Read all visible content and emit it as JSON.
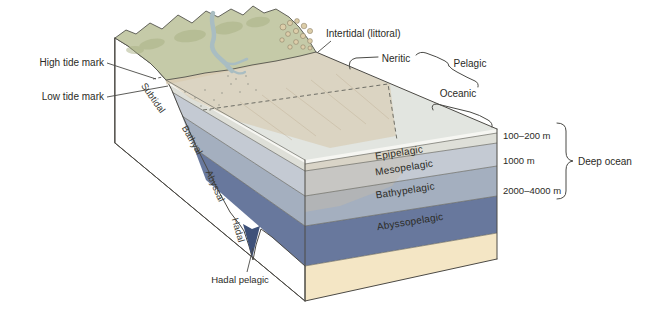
{
  "shore": {
    "high_tide": "High tide mark",
    "low_tide": "Low tide mark",
    "intertidal": "Intertidal (littoral)"
  },
  "surface_zones": {
    "neritic": "Neritic",
    "pelagic": "Pelagic",
    "oceanic": "Oceanic"
  },
  "benthic_zones": [
    "Subtidal",
    "Bathyal",
    "Abyssal",
    "Hadal"
  ],
  "pelagic_zones": [
    "Epipelagic",
    "Mesopelagic",
    "Bathypelagic",
    "Abyssopelagic",
    "Hadal pelagic"
  ],
  "depth_markers": [
    "100–200 m",
    "1000 m",
    "2000–4000 m"
  ],
  "deep_ocean_label": "Deep ocean",
  "colors": {
    "land": "#f1cda7",
    "terrain": "#c5caa8",
    "terrain_shade": "#a9b184",
    "river": "#a9bdc2",
    "beach": "#d8cbb2",
    "surface": "#e2e5e0",
    "shelf": "#d6c8ad",
    "epipelagic": "#dedfd8",
    "mesopelagic": "#c4cad3",
    "bathypelagic": "#a4afbf",
    "abyssopelagic": "#68789d",
    "trench": "#3e5179",
    "seafloor": "#f4e6c5",
    "white_strip": "#f6f6f2",
    "pebble": "#dccda9"
  }
}
